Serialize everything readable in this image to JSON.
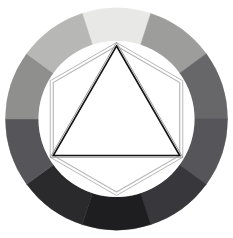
{
  "figure": {
    "title": "Tonal Value Wheel",
    "description": "Circular grayscale value wheel with inscribed hexagon and triangle outlines",
    "background_color": "#ffffff",
    "canvas": {
      "width": 233,
      "height": 238
    }
  },
  "chart_data": {
    "type": "pie",
    "title": "Tonal Value Wheel",
    "subtitle": "",
    "xlabel": "",
    "ylabel": "",
    "legend_position": "none",
    "grid": false,
    "center": {
      "cx": 116.5,
      "cy": 119,
      "units": "px"
    },
    "radii": {
      "outer": 111,
      "inner": 78,
      "units": "px"
    },
    "categories": [
      "top",
      "top-right",
      "right-upper",
      "right-lower",
      "bottom-right",
      "bottom",
      "bottom-left",
      "left-lower",
      "left-upper",
      "top-left"
    ],
    "values": [
      36,
      36,
      36,
      36,
      36,
      36,
      36,
      36,
      36,
      36
    ],
    "value_unit": "degrees",
    "series": [
      {
        "name": "grayscale value",
        "values": [
          94,
          62,
          40,
          33,
          22,
          12,
          16,
          33,
          56,
          72
        ],
        "value_unit": "percent lightness"
      }
    ],
    "segments": [
      {
        "label": "top",
        "start_angle": -18,
        "end_angle": 18,
        "color": "#e8e8e6",
        "lightness_pct": 94
      },
      {
        "label": "top-right",
        "start_angle": 18,
        "end_angle": 54,
        "color": "#9d9d9b",
        "lightness_pct": 62
      },
      {
        "label": "right-upper",
        "start_angle": 54,
        "end_angle": 90,
        "color": "#67676a",
        "lightness_pct": 40
      },
      {
        "label": "right-lower",
        "start_angle": 90,
        "end_angle": 126,
        "color": "#55555a",
        "lightness_pct": 33
      },
      {
        "label": "bottom-right",
        "start_angle": 126,
        "end_angle": 162,
        "color": "#38383c",
        "lightness_pct": 22
      },
      {
        "label": "bottom",
        "start_angle": 162,
        "end_angle": 198,
        "color": "#1e1e20",
        "lightness_pct": 12
      },
      {
        "label": "bottom-left",
        "start_angle": 198,
        "end_angle": 234,
        "color": "#2a2a2c",
        "lightness_pct": 16
      },
      {
        "label": "left-lower",
        "start_angle": 234,
        "end_angle": 270,
        "color": "#55555a",
        "lightness_pct": 33
      },
      {
        "label": "left-upper",
        "start_angle": 270,
        "end_angle": 306,
        "color": "#8f8f8d",
        "lightness_pct": 56
      },
      {
        "label": "top-left",
        "start_angle": 306,
        "end_angle": 342,
        "color": "#b7b7b5",
        "lightness_pct": 72
      }
    ],
    "overlays": [
      {
        "name": "hexagon",
        "shape": "hexagon",
        "sides": 6,
        "orientation": "pointy-bottom",
        "circumradius": 73,
        "stroke_color": "#b9b9b9",
        "stroke_width": 1.2,
        "fill": "none",
        "double_stroke": true
      },
      {
        "name": "triangle",
        "shape": "triangle",
        "sides": 3,
        "orientation": "point-up",
        "circumradius": 73,
        "stroke_color": "#141414",
        "stroke_width": 1.6,
        "fill": "none",
        "double_stroke": true
      }
    ],
    "inner_disc": {
      "color": "#ffffff",
      "radius": 78
    }
  }
}
